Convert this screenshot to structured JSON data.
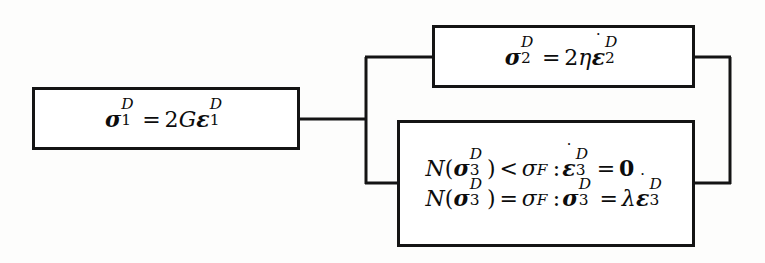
{
  "figure": {
    "kind": "rheological-model-block-diagram",
    "background_color": "#fdfdfc",
    "line_color": "#141414",
    "text_color": "#0c0c0c"
  },
  "elements": {
    "elastic": {
      "id": "box-1",
      "role": "elastic-element",
      "equation_plain": "sigma_1^D = 2 G epsilon_1^D",
      "lhs_symbol": "σ",
      "lhs_superscript": "D",
      "lhs_subscript": "1",
      "relation": "=",
      "coefficient": "2",
      "modulus": "G",
      "rhs_symbol": "ε",
      "rhs_superscript": "D",
      "rhs_subscript": "1"
    },
    "viscous": {
      "id": "box-2",
      "role": "viscous-element",
      "equation_plain": "sigma_2^D = 2 eta epsilon-dot_2^D",
      "lhs_symbol": "σ",
      "lhs_superscript": "D",
      "lhs_subscript": "2",
      "relation": "=",
      "coefficient": "2",
      "viscosity": "η",
      "rhs_symbol": "ε",
      "rhs_rate_dot": "˙",
      "rhs_superscript": "D",
      "rhs_subscript": "2"
    },
    "plastic": {
      "id": "box-3",
      "role": "plastic-yield-element",
      "line1_plain": "N(sigma_3^D) < sigma_F : epsilon-dot_3^D = 0",
      "line2_plain": "N(sigma_3^D) = sigma_F : sigma_3^D = lambda epsilon-dot_3^D",
      "norm_symbol": "N",
      "stress_symbol": "σ",
      "stress_superscript": "D",
      "stress_subscript": "3",
      "yield_symbol": "σ",
      "yield_subscript": "F",
      "relation_line1": "<",
      "relation_line2": "=",
      "colon": ":",
      "strain_rate_symbol": "ε",
      "strain_rate_dot": "˙",
      "strain_rate_superscript": "D",
      "strain_rate_subscript": "3",
      "zero_value": "0",
      "multiplier": "λ"
    }
  },
  "connectors": {
    "series_link_label": "series-connection",
    "left_branch_label": "parallel-split-left",
    "right_branch_label": "parallel-join-right"
  }
}
